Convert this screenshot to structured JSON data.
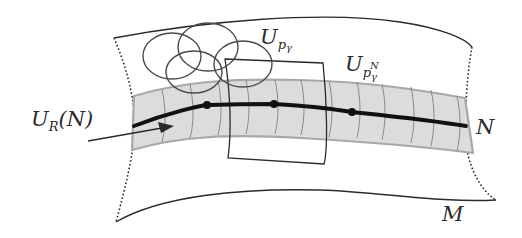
{
  "diagram": {
    "type": "manifold-neighborhood-illustration",
    "labels": {
      "tubular_neighborhood": {
        "base": "U",
        "sub": "R",
        "arg": "(N)"
      },
      "chart_p_gamma": {
        "base": "U",
        "sub": "p",
        "subsub": "γ"
      },
      "chart_p_gamma_N": {
        "base": "U",
        "sub": "p",
        "subsub": "γ",
        "sup": "N"
      },
      "submanifold": "N",
      "manifold": "M"
    },
    "elements": {
      "manifold_patch": "curved quadrilateral with solid top/bottom edges and dotted left/right edges",
      "tube_band": "shaded gray strip around curve N with transverse grid lines",
      "curve_N": "thick black curve through the band",
      "points_on_N": 3,
      "covering_circles": 5,
      "chart_rectangle": "curved rectangle U_{p_γ}",
      "arrow": "pointer to U_R(N)"
    },
    "colors": {
      "ink": "#2a2a2a",
      "band_fill": "#dcdcdc",
      "band_edge": "#a8a8a8",
      "grid_line": "#8a8a8a",
      "circle_stroke": "#4a4a4a",
      "background": "#ffffff"
    }
  }
}
